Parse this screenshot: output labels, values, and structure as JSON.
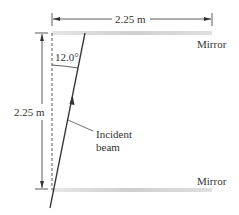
{
  "diagram": {
    "type": "optics-mirrors",
    "top_width_label": "2.25 m",
    "height_label": "2.25 m",
    "angle_label": "12.0°",
    "top_mirror_label": "Mirror",
    "bottom_mirror_label": "Mirror",
    "beam_label_line1": "Incident",
    "beam_label_line2": "beam",
    "colors": {
      "line": "#333333",
      "mirror": "#d6d6d6",
      "text": "#333333"
    }
  }
}
